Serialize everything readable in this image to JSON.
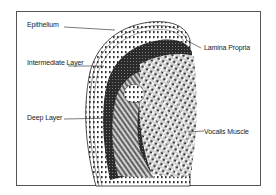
{
  "diagram": {
    "type": "anatomical cross-section (vocal fold)",
    "labels": [
      {
        "id": "epithelium",
        "text": "Epithelium"
      },
      {
        "id": "lamina-propria",
        "text": "Lamina Propria"
      },
      {
        "id": "intermediate-layer",
        "text": "Intermediate Layer"
      },
      {
        "id": "deep-layer",
        "text": "Deep Layer"
      },
      {
        "id": "vocalis-muscle",
        "text": "Vocalis Muscle"
      }
    ],
    "colors": {
      "frame": "#555555",
      "ink": "#1a1a1a",
      "background": "#ffffff"
    }
  }
}
